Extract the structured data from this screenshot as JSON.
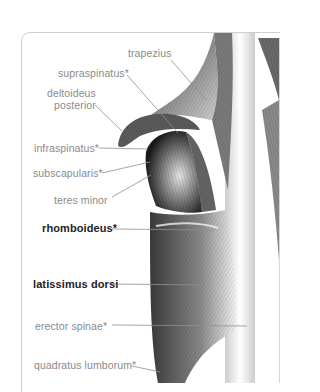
{
  "figure": {
    "colors": {
      "label_regular": "#8a8a8a",
      "label_bold": "#1e1e1e",
      "leader_line": "#8f8f8f",
      "panel_border": "#cfcfcf"
    },
    "labels": [
      {
        "id": "trapezius",
        "text": "trapezius",
        "bold": false
      },
      {
        "id": "supraspinatus",
        "text": "supraspinatus*",
        "bold": false
      },
      {
        "id": "deltoideus",
        "text_line1": "deltoideus",
        "text_line2": "posterior",
        "bold": false
      },
      {
        "id": "infraspinatus",
        "text": "infraspinatus*",
        "bold": false
      },
      {
        "id": "subscapularis",
        "text": "subscapularis*",
        "bold": false
      },
      {
        "id": "teres-minor",
        "text": "teres minor",
        "bold": false
      },
      {
        "id": "rhomboideus",
        "text": "rhomboideus*",
        "bold": true
      },
      {
        "id": "latissimus-dorsi",
        "text": "latissimus dorsi",
        "bold": true
      },
      {
        "id": "erector-spinae",
        "text": "erector spinae*",
        "bold": false
      },
      {
        "id": "quadratus-lumborum",
        "text": "quadratus lumborum*",
        "bold": false
      }
    ]
  }
}
